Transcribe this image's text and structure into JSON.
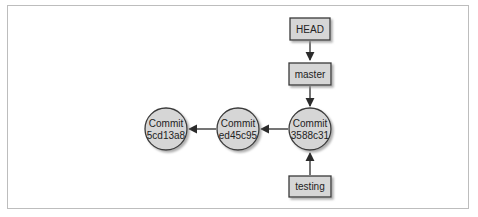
{
  "diagram": {
    "type": "git-branch-graph",
    "colors": {
      "node_fill": "#d6d6d6",
      "node_stroke": "#3a3a3a",
      "edge": "#2b2b2b",
      "shadow": "#b5b5b5",
      "frame": "#bdbdbd"
    },
    "refs": [
      {
        "id": "head",
        "label": "HEAD",
        "points_to": "master"
      },
      {
        "id": "master",
        "label": "master",
        "points_to": "c3"
      },
      {
        "id": "testing",
        "label": "testing",
        "points_to": "c3"
      }
    ],
    "commits": [
      {
        "id": "c1",
        "line1": "Commit",
        "line2": "5cd13a8",
        "parent": null
      },
      {
        "id": "c2",
        "line1": "Commit",
        "line2": "ed45c95",
        "parent": "c1"
      },
      {
        "id": "c3",
        "line1": "Commit",
        "line2": "3588c31",
        "parent": "c2"
      }
    ]
  }
}
